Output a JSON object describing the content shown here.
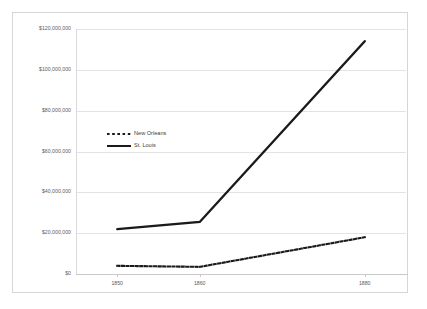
{
  "chart_data": {
    "type": "line",
    "title": "",
    "subtitle": "",
    "xlabel": "",
    "ylabel": "",
    "x": [
      1850,
      1860,
      1880
    ],
    "xlim": [
      1845,
      1885
    ],
    "ylim": [
      0,
      120000000
    ],
    "grid": true,
    "legend_position": "inside-upper-left",
    "y_tick_labels": [
      "$120,000,000",
      "$100,000,000",
      "$80,000,000",
      "$60,000,000",
      "$40,000,000",
      "$20,000,000",
      "$0"
    ],
    "y_tick_values": [
      120000000,
      100000000,
      80000000,
      60000000,
      40000000,
      20000000,
      0
    ],
    "x_tick_labels": [
      "1850",
      "1860",
      "1880"
    ],
    "x_tick_values": [
      1850,
      1860,
      1880
    ],
    "series": [
      {
        "name": "New Orleans",
        "style": "dotted",
        "color": "#1a1a1a",
        "values": [
          4000000,
          3500000,
          18000000
        ]
      },
      {
        "name": "St. Louis",
        "style": "solid",
        "color": "#1a1a1a",
        "values": [
          22000000,
          25500000,
          114000000
        ]
      }
    ]
  },
  "legend": {
    "items": [
      {
        "label": "New Orleans",
        "marker": "dotted-line-swatch"
      },
      {
        "label": "St. Louis",
        "marker": "solid-line-swatch"
      }
    ]
  },
  "colors": {
    "series_line": "#1a1a1a",
    "gridline": "#e3e3e3",
    "axis": "#c9c9c9",
    "tick_text": "#5b5b5b",
    "legend_text": "#3d3d3d",
    "frame_border": "#d6d6d6",
    "background": "#ffffff"
  }
}
